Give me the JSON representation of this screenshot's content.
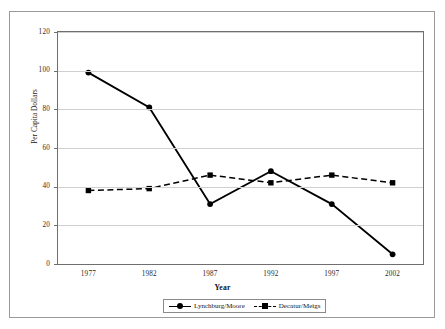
{
  "chart_data": {
    "type": "line",
    "title": "",
    "xlabel": "Year",
    "ylabel": "Per Capita Dollars",
    "categories": [
      "1977",
      "1982",
      "1987",
      "1992",
      "1997",
      "2002"
    ],
    "x": [
      1977,
      1982,
      1987,
      1992,
      1997,
      2002
    ],
    "ylim": [
      0,
      120
    ],
    "yticks": [
      0,
      20,
      40,
      60,
      80,
      100,
      120
    ],
    "ytick_labels": [
      "0",
      "20",
      "40",
      "60",
      "80",
      "100",
      "120"
    ],
    "grid": "horizontal",
    "legend_position": "bottom-center",
    "series": [
      {
        "name": "Lynchburg/Moore",
        "values": [
          99,
          81,
          31,
          48,
          31,
          5
        ],
        "line_style": "solid",
        "marker": "circle",
        "color": "#000000"
      },
      {
        "name": "Decatur/Meigs",
        "values": [
          38,
          39,
          46,
          42,
          46,
          42
        ],
        "line_style": "dashed",
        "marker": "square",
        "color": "#000000"
      }
    ]
  },
  "axis": {
    "y_title": "Per Capita Dollars",
    "x_title": "Year"
  },
  "legend": {
    "items": [
      {
        "label": "Lynchburg/Moore"
      },
      {
        "label": "Decatur/Meigs"
      }
    ]
  },
  "colors": {
    "series": "#000000",
    "gridline": "#d0d0d0",
    "axis": "#6f6f6f",
    "frame": "#9a9a9a",
    "background": "#ffffff"
  }
}
